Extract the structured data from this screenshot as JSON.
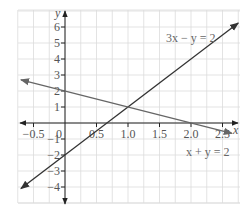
{
  "chart_data": {
    "type": "line",
    "title": "",
    "xlabel": "x",
    "ylabel": "y",
    "xlim": [
      -0.75,
      2.75
    ],
    "ylim": [
      -5,
      7
    ],
    "grid": true,
    "x_ticks": [
      "-0.5",
      "0",
      "0.5",
      "1.0",
      "1.5",
      "2.0",
      "2.5"
    ],
    "x_tick_values": [
      -0.5,
      0,
      0.5,
      1.0,
      1.5,
      2.0,
      2.5
    ],
    "y_ticks": [
      "6",
      "5",
      "4",
      "3",
      "2",
      "1",
      "-1",
      "-2",
      "-3",
      "-4"
    ],
    "y_tick_values": [
      6,
      5,
      4,
      3,
      2,
      1,
      -1,
      -2,
      -3,
      -4
    ],
    "series": [
      {
        "name": "3x − y = 2",
        "equation": "y = 3x - 2",
        "color": "#333333",
        "x": [
          -0.7,
          2.75
        ],
        "y": [
          -4.1,
          6.25
        ]
      },
      {
        "name": "x + y = 2",
        "equation": "y = 2 - x",
        "color": "#666666",
        "x": [
          -0.7,
          2.65
        ],
        "y": [
          2.7,
          -0.65
        ]
      }
    ],
    "annotations": [
      {
        "text": "3x − y = 2",
        "x": 1.95,
        "y": 5.3
      },
      {
        "text": "x + y = 2",
        "x": 1.8,
        "y": -1.6
      }
    ],
    "intersection": {
      "x": 1.0,
      "y": 1.0
    }
  },
  "labels": {
    "x_axis": "x",
    "y_axis": "y",
    "eq1": "3x − y = 2",
    "eq2": "x + y = 2"
  },
  "colors": {
    "axis": "#333333",
    "grid": "#dcdcdc",
    "line1": "#333333",
    "line2": "#666666"
  }
}
